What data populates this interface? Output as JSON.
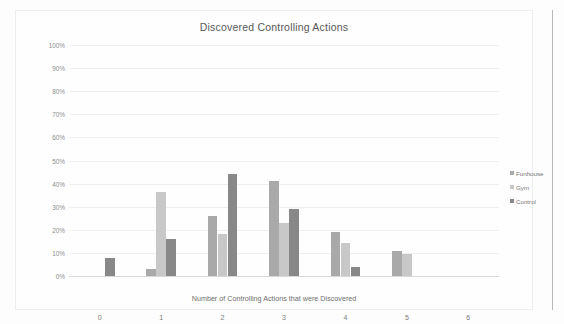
{
  "chart_data": {
    "type": "bar",
    "title": "Discovered Controlling Actions",
    "xlabel": "Number of Controlling Actions that were Discovered",
    "ylabel": "Percentage of Experimental Sessions",
    "categories": [
      "0",
      "1",
      "2",
      "3",
      "4",
      "5",
      "6"
    ],
    "ylim": [
      0,
      100
    ],
    "ytick_labels": [
      "0%",
      "10%",
      "20%",
      "30%",
      "40%",
      "50%",
      "60%",
      "70%",
      "80%",
      "90%",
      "100%"
    ],
    "ytick_values": [
      0,
      10,
      20,
      30,
      40,
      50,
      60,
      70,
      80,
      90,
      100
    ],
    "grid": true,
    "legend_position": "right",
    "series": [
      {
        "name": "Funhouse",
        "color": "#a9a9a9",
        "values": [
          0,
          3,
          26,
          41,
          19,
          11,
          0
        ]
      },
      {
        "name": "Gym",
        "color": "#c8c8c8",
        "values": [
          0,
          36.5,
          18,
          23,
          14.5,
          9.5,
          0
        ]
      },
      {
        "name": "Control",
        "color": "#888888",
        "values": [
          8,
          16,
          44,
          29,
          4,
          0,
          0
        ]
      }
    ]
  },
  "legend": {
    "items": [
      {
        "label": "Funhouse",
        "color": "#a9a9a9"
      },
      {
        "label": "Gym",
        "color": "#c8c8c8"
      },
      {
        "label": "Control",
        "color": "#888888"
      }
    ]
  }
}
